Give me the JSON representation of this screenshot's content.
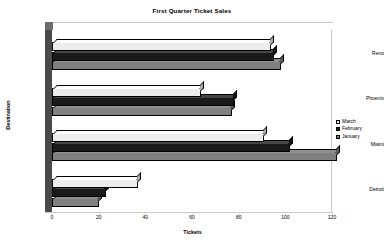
{
  "chart_data": {
    "type": "bar",
    "orientation": "horizontal",
    "title": "First Quarter Ticket Sales",
    "xlabel": "Tickets",
    "ylabel": "Destination",
    "categories": [
      "Detroit",
      "Miami",
      "Phoenix",
      "Reno"
    ],
    "series": [
      {
        "name": "January",
        "color": "#808080",
        "values": [
          20,
          122,
          77,
          98
        ]
      },
      {
        "name": "February",
        "color": "#1a1a1a",
        "values": [
          23,
          102,
          78,
          95
        ]
      },
      {
        "name": "March",
        "color": "#ededed",
        "values": [
          37,
          91,
          64,
          94
        ]
      }
    ],
    "xlim": [
      0,
      120
    ],
    "xticks": [
      0,
      20,
      40,
      60,
      80,
      100,
      120
    ],
    "ylim_categories": 4,
    "grid": false,
    "legend_position": "right",
    "style": "3d-clustered-bar"
  },
  "legend": {
    "entries": [
      {
        "label": "March",
        "swatch": "#ededed"
      },
      {
        "label": "February",
        "swatch": "#1a1a1a"
      },
      {
        "label": "January",
        "swatch": "#808080"
      }
    ]
  },
  "axes": {
    "x_tick_labels": [
      "0",
      "20",
      "40",
      "60",
      "80",
      "100",
      "120"
    ],
    "y_tick_labels": [
      "Reno",
      "Phoenix",
      "Miami",
      "Detroit"
    ]
  }
}
